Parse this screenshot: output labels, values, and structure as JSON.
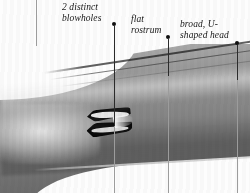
{
  "figure": {
    "annotations": [
      {
        "id": "blowholes",
        "text": "2 distinct\nblowholes",
        "bullet": {
          "x": 112,
          "y": 22
        },
        "leader": {
          "x": 114,
          "y_start": 26,
          "y_end": 126
        }
      },
      {
        "id": "rostrum",
        "text": "flat\nrostrum",
        "bullet": {
          "x": 166,
          "y": 35
        },
        "leader": {
          "x": 168,
          "y_start": 39,
          "y_end": 76
        }
      },
      {
        "id": "head",
        "text": "broad, U-\nshaped head",
        "bullet": {
          "x": 235,
          "y": 41
        },
        "leader": {
          "x": 237,
          "y_start": 45,
          "y_end": 80
        }
      }
    ],
    "rules": [
      {
        "id": "left-edge-rule",
        "x": 36,
        "y_start": 0,
        "y_end": 46
      },
      {
        "id": "blowhole-lower-rule",
        "x": 114,
        "y_start": 126,
        "y_end": 193
      },
      {
        "id": "rostrum-lower-rule",
        "x": 168,
        "y_start": 76,
        "y_end": 193
      },
      {
        "id": "head-lower-rule",
        "x": 237,
        "y_start": 80,
        "y_end": 193
      }
    ],
    "colors": {
      "background": "#ffffff",
      "ink": "#161616",
      "leader": "#2b2b2b",
      "rule": "#9c9c9c",
      "body_light": "#b9b9b9",
      "body_dark": "#636363",
      "blowhole": "#111111"
    }
  }
}
